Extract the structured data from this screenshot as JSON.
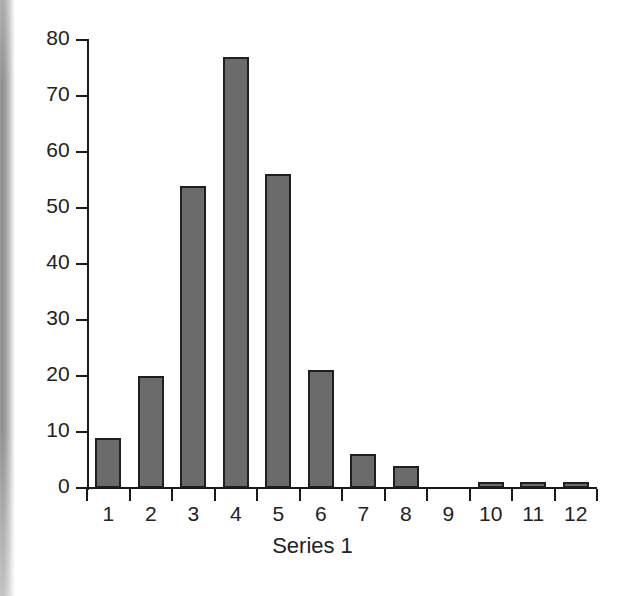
{
  "chart_data": {
    "type": "bar",
    "title": "",
    "subtitle": "",
    "xlabel": "Series 1",
    "ylabel": "",
    "categories": [
      "1",
      "2",
      "3",
      "4",
      "5",
      "6",
      "7",
      "8",
      "9",
      "10",
      "11",
      "12"
    ],
    "values": [
      9,
      20,
      54,
      77,
      56,
      21,
      6,
      4,
      0,
      1,
      1,
      1
    ],
    "series": [
      {
        "name": "Series 1",
        "values": [
          9,
          20,
          54,
          77,
          56,
          21,
          6,
          4,
          0,
          1,
          1,
          1
        ]
      }
    ],
    "ylim": [
      0,
      80
    ],
    "y_ticks": [
      0,
      10,
      20,
      30,
      40,
      50,
      60,
      70,
      80
    ],
    "y_tick_labels": [
      "0",
      "10",
      "20",
      "30",
      "40",
      "50",
      "60",
      "70",
      "80"
    ],
    "x_tick_labels": [
      "1",
      "2",
      "3",
      "4",
      "5",
      "6",
      "7",
      "8",
      "9",
      "10",
      "11",
      "12"
    ],
    "grid": false,
    "legend": false,
    "legend_position": "none",
    "annotations": [],
    "colors": {
      "bar_fill": "#6b6b6b",
      "bar_stroke": "#1f1f1f",
      "axis": "#1a1a1a",
      "text": "#222222",
      "background": "#ffffff"
    }
  }
}
